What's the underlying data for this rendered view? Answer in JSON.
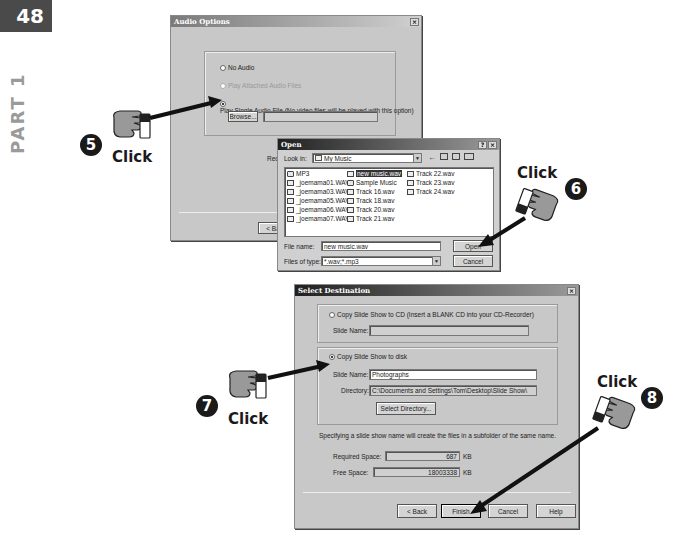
{
  "page": {
    "number": "48",
    "part": "PART 1"
  },
  "audio_options": {
    "title": "Audio Options",
    "close": "×",
    "options": [
      {
        "label": "No Audio",
        "checked": false,
        "disabled": false
      },
      {
        "label": "Play Attached Audio Files",
        "checked": false,
        "disabled": true
      },
      {
        "label": "Play Single Audio File (No video files will be played with this option)",
        "checked": true,
        "disabled": false
      }
    ],
    "browse_label": "Browse...",
    "file_path": "",
    "req_label": "Req",
    "back_label": "< Ba"
  },
  "open_dialog": {
    "title": "Open",
    "help": "?",
    "close": "×",
    "look_in_label": "Look in:",
    "look_in_value": "My Music",
    "files": [
      {
        "name": "MP3",
        "type": "folder",
        "selected": false
      },
      {
        "name": "_joemama01.WAV",
        "type": "audio",
        "selected": false
      },
      {
        "name": "_joemama03.WAV",
        "type": "audio",
        "selected": false
      },
      {
        "name": "_joemama05.WAV",
        "type": "audio",
        "selected": false
      },
      {
        "name": "_joemama06.WAV",
        "type": "audio",
        "selected": false
      },
      {
        "name": "_joemama07.WAV",
        "type": "audio",
        "selected": false
      },
      {
        "name": "new music.wav",
        "type": "audio",
        "selected": true
      },
      {
        "name": "Sample Music",
        "type": "folder",
        "selected": false
      },
      {
        "name": "Track 16.wav",
        "type": "audio",
        "selected": false
      },
      {
        "name": "Track 18.wav",
        "type": "audio",
        "selected": false
      },
      {
        "name": "Track 20.wav",
        "type": "audio",
        "selected": false
      },
      {
        "name": "Track 21.wav",
        "type": "audio",
        "selected": false
      },
      {
        "name": "Track 22.wav",
        "type": "audio",
        "selected": false
      },
      {
        "name": "Track 23.wav",
        "type": "audio",
        "selected": false
      },
      {
        "name": "Track 24.wav",
        "type": "audio",
        "selected": false
      }
    ],
    "file_name_label": "File name:",
    "file_name_value": "new music.wav",
    "file_type_label": "Files of type:",
    "file_type_value": "*.wav;*.mp3",
    "open_label": "Open",
    "cancel_label": "Cancel"
  },
  "select_destination": {
    "title": "Select Destination",
    "close": "×",
    "cd_option": "Copy Slide Show to CD (Insert a BLANK CD into your CD-Recorder)",
    "cd_slide_name_label": "Slide Name:",
    "cd_slide_name_value": "",
    "disk_option": "Copy Slide Show to disk",
    "disk_slide_name_label": "Slide Name:",
    "disk_slide_name_value": "Photographs",
    "directory_label": "Directory:",
    "directory_value": "C:\\Documents and Settings\\Tom\\Desktop\\Slide Show\\",
    "select_directory_label": "Select Directory...",
    "hint": "Specifying a slide show name will create the files in a subfolder of the same name.",
    "required_space_label": "Required Space:",
    "required_space_value": "687",
    "free_space_label": "Free Space:",
    "free_space_value": "18003338",
    "unit": "KB",
    "back_label": "< Back",
    "finish_label": "Finish",
    "cancel_label": "Cancel",
    "help_label": "Help"
  },
  "callouts": [
    {
      "step": "5",
      "text": "Click"
    },
    {
      "step": "6",
      "text": "Click"
    },
    {
      "step": "7",
      "text": "Click"
    },
    {
      "step": "8",
      "text": "Click"
    }
  ]
}
